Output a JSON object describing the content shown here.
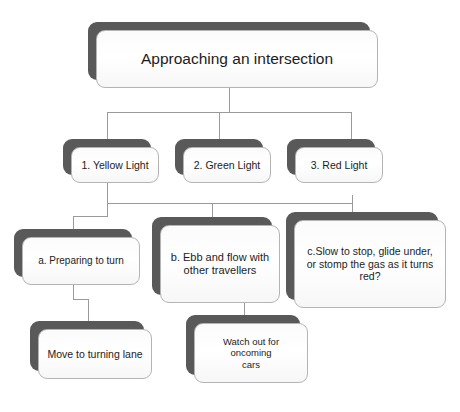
{
  "diagram": {
    "background_color": "#ffffff",
    "shadow_color": "#595959",
    "card_border_color": "#b4b4b4",
    "connector_color": "#9a9a9a",
    "text_color": "#1c1c1c"
  },
  "nodes": {
    "root": {
      "label": "Approaching an intersection"
    },
    "level2": [
      {
        "label": "1. Yellow Light"
      },
      {
        "label": "2. Green Light"
      },
      {
        "label": "3. Red Light"
      }
    ],
    "level3": [
      {
        "label": "a. Preparing to turn"
      },
      {
        "label": "b. Ebb and flow with\nother travellers"
      },
      {
        "label": "c.Slow to stop, glide under,\nor stomp the gas as it turns\nred?"
      }
    ],
    "level4": [
      {
        "label": "Move to turning lane"
      },
      {
        "label": "Watch out for oncoming\ncars"
      }
    ]
  }
}
